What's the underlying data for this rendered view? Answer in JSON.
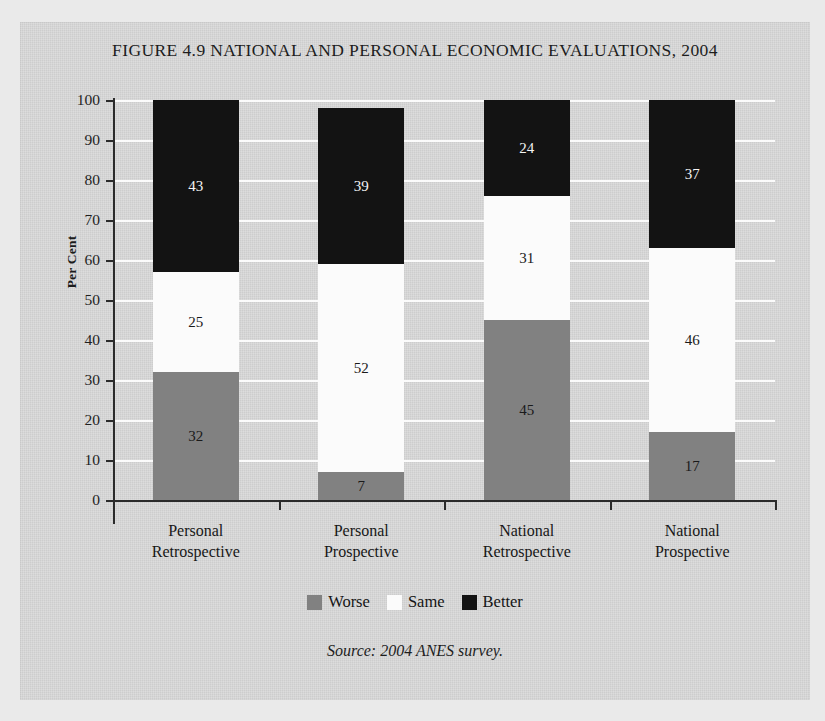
{
  "figure": {
    "title": "FIGURE 4.9 NATIONAL AND PERSONAL ECONOMIC EVALUATIONS, 2004",
    "source_note": "Source: 2004 ANES survey."
  },
  "axes": {
    "ylabel": "Per Cent",
    "yticks": [
      "100",
      "90",
      "80",
      "70",
      "60",
      "50",
      "40",
      "30",
      "20",
      "10",
      "0"
    ]
  },
  "legend": {
    "items": [
      {
        "label": "Worse",
        "color": "#818181"
      },
      {
        "label": "Same",
        "color": "#fbfbfb"
      },
      {
        "label": "Better",
        "color": "#131313"
      }
    ]
  },
  "categories": [
    {
      "line1": "Personal",
      "line2": "Retrospective"
    },
    {
      "line1": "Personal",
      "line2": "Prospective"
    },
    {
      "line1": "National",
      "line2": "Retrospective"
    },
    {
      "line1": "National",
      "line2": "Prospective"
    }
  ],
  "bars": [
    {
      "worse": "32",
      "same": "25",
      "better": "43"
    },
    {
      "worse": "7",
      "same": "52",
      "better": "39"
    },
    {
      "worse": "45",
      "same": "31",
      "better": "24"
    },
    {
      "worse": "17",
      "same": "46",
      "better": "37"
    }
  ],
  "chart_data": {
    "type": "bar",
    "subtype": "stacked-vertical-100",
    "title": "FIGURE 4.9 NATIONAL AND PERSONAL ECONOMIC EVALUATIONS, 2004",
    "xlabel": "",
    "ylabel": "Per Cent",
    "ylim": [
      0,
      100
    ],
    "ytick_step": 10,
    "grid": "horizontal-white-gridlines",
    "legend_position": "bottom-center",
    "categories": [
      "Personal Retrospective",
      "Personal Prospective",
      "National Retrospective",
      "National Prospective"
    ],
    "series": [
      {
        "name": "Worse",
        "color": "#818181",
        "values": [
          32,
          7,
          45,
          17
        ]
      },
      {
        "name": "Same",
        "color": "#fbfbfb",
        "values": [
          25,
          52,
          31,
          46
        ]
      },
      {
        "name": "Better",
        "color": "#131313",
        "values": [
          43,
          39,
          24,
          37
        ]
      }
    ],
    "stack_totals": [
      100,
      98,
      100,
      100
    ],
    "data_labels_shown": true,
    "source_note": "Source: 2004 ANES survey."
  }
}
